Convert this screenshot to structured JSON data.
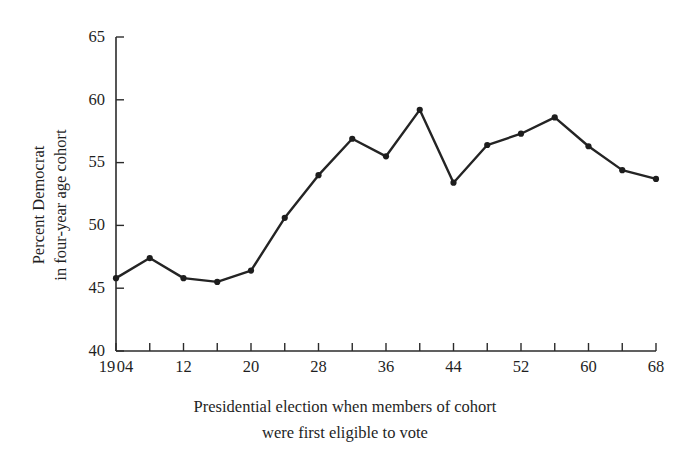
{
  "chart_data": {
    "type": "line",
    "title": "",
    "subtitle": "",
    "xlabel_line1": "Presidential election when members of cohort",
    "xlabel_line2": "were first eligible to vote",
    "ylabel_line1": "Percent Democrat",
    "ylabel_line2": "in four-year age cohort",
    "xlim": [
      1904,
      1968
    ],
    "ylim": [
      40,
      65
    ],
    "grid": false,
    "legend": "none",
    "x_tick_step": 4,
    "y_tick_step": 5,
    "y_ticks": [
      40,
      45,
      50,
      55,
      60,
      65
    ],
    "y_tick_labels": [
      "40",
      "45",
      "50",
      "55",
      "60",
      "65"
    ],
    "x": [
      1904,
      1908,
      1912,
      1916,
      1920,
      1924,
      1928,
      1932,
      1936,
      1940,
      1944,
      1948,
      1952,
      1956,
      1960,
      1964,
      1968
    ],
    "x_tick_labels": [
      "1904",
      "",
      "12",
      "",
      "20",
      "",
      "28",
      "",
      "36",
      "",
      "44",
      "",
      "52",
      "",
      "60",
      "",
      "68"
    ],
    "x_first_label_prefix": "19",
    "x_first_label_suffix": "04",
    "values": [
      45.8,
      47.4,
      45.8,
      45.5,
      46.4,
      50.6,
      54.0,
      56.9,
      55.5,
      59.2,
      53.4,
      56.4,
      57.3,
      58.6,
      56.3,
      54.4,
      53.7
    ],
    "series": [
      {
        "name": "Percent Democrat in four-year age cohort",
        "values": [
          45.8,
          47.4,
          45.8,
          45.5,
          46.4,
          50.6,
          54.0,
          56.9,
          55.5,
          59.2,
          53.4,
          56.4,
          57.3,
          58.6,
          56.3,
          54.4,
          53.7
        ]
      }
    ],
    "colors": {
      "line": "#242424",
      "marker": "#1d1d1d",
      "axis": "#2b2b2b",
      "text": "#1f1f1f",
      "background": "#ffffff"
    }
  }
}
